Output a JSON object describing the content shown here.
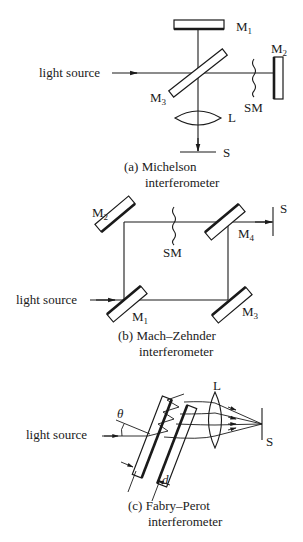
{
  "figure": {
    "panels": [
      {
        "id": "a",
        "caption_line1": "(a) Michelson",
        "caption_line2": "interferometer",
        "labels": {
          "source": "light source",
          "m1": "M",
          "m1_sub": "1",
          "m2": "M",
          "m2_sub": "2",
          "m3": "M",
          "m3_sub": "3",
          "sm": "SM",
          "lens": "L",
          "screen": "S"
        }
      },
      {
        "id": "b",
        "caption_line1": "(b) Mach–Zehnder",
        "caption_line2": "interferometer",
        "labels": {
          "source": "light source",
          "m1": "M",
          "m1_sub": "1",
          "m2": "M",
          "m2_sub": "2",
          "m3": "M",
          "m3_sub": "3",
          "m4": "M",
          "m4_sub": "4",
          "sm": "SM",
          "screen": "S"
        }
      },
      {
        "id": "c",
        "caption_line1": "(c) Fabry–Perot",
        "caption_line2": "interferometer",
        "labels": {
          "source": "light source",
          "angle": "θ",
          "spacing": "d",
          "lens": "L",
          "screen": "S"
        }
      }
    ]
  }
}
